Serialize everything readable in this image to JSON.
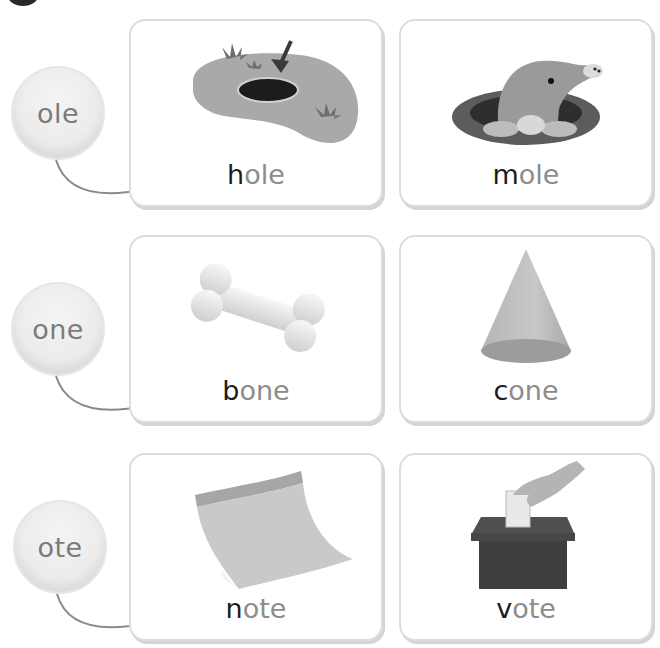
{
  "rows": [
    {
      "family": "ole",
      "cards": [
        {
          "onset": "h",
          "rime": "ole",
          "word": "hole",
          "image": "hole-in-ground-with-arrow"
        },
        {
          "onset": "m",
          "rime": "ole",
          "word": "mole",
          "image": "mole-in-burrow"
        }
      ]
    },
    {
      "family": "one",
      "cards": [
        {
          "onset": "b",
          "rime": "one",
          "word": "bone",
          "image": "bone"
        },
        {
          "onset": "c",
          "rime": "one",
          "word": "cone",
          "image": "cone"
        }
      ]
    },
    {
      "family": "ote",
      "cards": [
        {
          "onset": "n",
          "rime": "ote",
          "word": "note",
          "image": "curled-note-paper"
        },
        {
          "onset": "v",
          "rime": "ote",
          "word": "vote",
          "image": "hand-voting-ballot-box"
        }
      ]
    }
  ],
  "colors": {
    "onset": "#1c1c1c",
    "rime": "#8c8c8c",
    "card_border": "#dcdcdc",
    "connector": "#8a8a8a"
  }
}
